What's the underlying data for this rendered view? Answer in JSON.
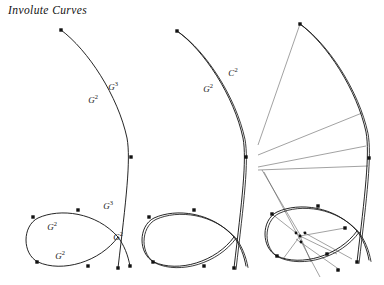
{
  "figure": {
    "title": "Involute Curves",
    "background_color": "#ffffff",
    "stroke_color": "#1a1a1a",
    "thin_stroke_color": "#555555",
    "marker_color": "#111111",
    "width": 384,
    "height": 285
  },
  "chart_data": {
    "type": "diagram",
    "title": "Involute Curves",
    "xlabel": "",
    "ylabel": "",
    "grid": false,
    "legend": null,
    "panels": [
      {
        "id": "left",
        "name": "single-curve-panel",
        "curve_style": "single",
        "elements": [
          {
            "kind": "arc",
            "name": "main-arc",
            "path": "M 61 30 C 88 50 118 96 127 138 C 131 160 126 200 118 268",
            "doubled": false
          },
          {
            "kind": "loop",
            "name": "teardrop-loop",
            "path": "M 118 237 C 96 212 60 208 38 218 C 22 226 22 254 38 262 C 62 273 100 262 118 237",
            "doubled": false
          },
          {
            "kind": "tail",
            "name": "loop-tail",
            "path": "M 118 237 C 124 245 128 255 130 266",
            "doubled": false
          }
        ],
        "markers": [
          {
            "x": 61,
            "y": 30,
            "shape": "square"
          },
          {
            "x": 131,
            "y": 157,
            "shape": "square"
          },
          {
            "x": 118,
            "y": 268,
            "shape": "square"
          },
          {
            "x": 33,
            "y": 217,
            "shape": "square"
          },
          {
            "x": 37,
            "y": 262,
            "shape": "square"
          },
          {
            "x": 78,
            "y": 210,
            "shape": "square"
          },
          {
            "x": 88,
            "y": 266,
            "shape": "square"
          },
          {
            "x": 130,
            "y": 266,
            "shape": "square"
          }
        ],
        "labels": [
          {
            "text": "G",
            "sup": "2",
            "x": 93,
            "y": 100
          },
          {
            "text": "G",
            "sup": "3",
            "x": 113,
            "y": 87
          },
          {
            "text": "G",
            "sup": "3",
            "x": 108,
            "y": 206
          },
          {
            "text": "G",
            "sup": "2",
            "x": 118,
            "y": 237
          },
          {
            "text": "G",
            "sup": "2",
            "x": 52,
            "y": 227
          },
          {
            "text": "G",
            "sup": "2",
            "x": 60,
            "y": 256
          }
        ]
      },
      {
        "id": "middle",
        "name": "doubled-curve-panel",
        "curve_style": "doubled",
        "elements": [
          {
            "kind": "arc",
            "name": "main-arc",
            "path": "M 177 31 C 204 50 234 96 243 138 C 247 160 242 200 234 268",
            "doubled": true
          },
          {
            "kind": "loop",
            "name": "teardrop-loop",
            "path": "M 234 237 C 212 212 176 208 154 218 C 138 226 138 254 154 262 C 178 273 216 262 234 237",
            "doubled": true
          },
          {
            "kind": "tail",
            "name": "loop-tail",
            "path": "M 234 237 C 240 245 244 255 246 266",
            "doubled": true
          }
        ],
        "markers": [
          {
            "x": 177,
            "y": 31,
            "shape": "square"
          },
          {
            "x": 246,
            "y": 157,
            "shape": "square"
          },
          {
            "x": 234,
            "y": 268,
            "shape": "square"
          },
          {
            "x": 149,
            "y": 217,
            "shape": "square"
          },
          {
            "x": 153,
            "y": 262,
            "shape": "square"
          },
          {
            "x": 194,
            "y": 210,
            "shape": "square"
          },
          {
            "x": 204,
            "y": 266,
            "shape": "square"
          }
        ],
        "labels": [
          {
            "text": "G",
            "sup": "2",
            "x": 208,
            "y": 89
          },
          {
            "text": "C",
            "sup": "2",
            "x": 233,
            "y": 73
          }
        ]
      },
      {
        "id": "right",
        "name": "involute-ray-panel",
        "curve_style": "doubled",
        "elements": [
          {
            "kind": "arc",
            "name": "main-arc",
            "path": "M 300 24 C 327 44 357 90 366 132 C 370 154 365 194 357 262",
            "doubled": true
          },
          {
            "kind": "loop",
            "name": "teardrop-loop",
            "path": "M 357 231 C 335 206 299 202 277 212 C 261 220 261 248 277 256 C 301 267 339 256 357 231",
            "doubled": true
          },
          {
            "kind": "tail",
            "name": "loop-tail",
            "path": "M 357 231 C 363 239 367 249 369 260",
            "doubled": true
          }
        ],
        "rays": [
          {
            "x1": 300,
            "y1": 24,
            "x2": 258,
            "y2": 145
          },
          {
            "x1": 362,
            "y1": 113,
            "x2": 258,
            "y2": 155
          },
          {
            "x1": 366,
            "y1": 146,
            "x2": 258,
            "y2": 167
          },
          {
            "x1": 368,
            "y1": 166,
            "x2": 258,
            "y2": 170
          },
          {
            "x1": 264,
            "y1": 172,
            "x2": 320,
            "y2": 277
          },
          {
            "x1": 262,
            "y1": 170,
            "x2": 302,
            "y2": 238
          },
          {
            "x1": 300,
            "y1": 236,
            "x2": 272,
            "y2": 214
          },
          {
            "x1": 300,
            "y1": 236,
            "x2": 345,
            "y2": 228
          },
          {
            "x1": 300,
            "y1": 236,
            "x2": 337,
            "y2": 254
          },
          {
            "x1": 300,
            "y1": 236,
            "x2": 283,
            "y2": 259
          },
          {
            "x1": 300,
            "y1": 236,
            "x2": 311,
            "y2": 262
          },
          {
            "x1": 303,
            "y1": 232,
            "x2": 352,
            "y2": 259
          },
          {
            "x1": 296,
            "y1": 239,
            "x2": 340,
            "y2": 270
          }
        ],
        "markers": [
          {
            "x": 300,
            "y": 24,
            "shape": "square"
          },
          {
            "x": 369,
            "y": 158,
            "shape": "square"
          },
          {
            "x": 357,
            "y": 262,
            "shape": "square"
          },
          {
            "x": 272,
            "y": 214,
            "shape": "square"
          },
          {
            "x": 277,
            "y": 256,
            "shape": "square"
          },
          {
            "x": 318,
            "y": 206,
            "shape": "square"
          },
          {
            "x": 327,
            "y": 254,
            "shape": "square"
          },
          {
            "x": 345,
            "y": 228,
            "shape": "square"
          },
          {
            "x": 338,
            "y": 270,
            "shape": "square"
          },
          {
            "x": 300,
            "y": 236,
            "shape": "dot"
          },
          {
            "x": 296,
            "y": 233,
            "shape": "dot"
          },
          {
            "x": 305,
            "y": 233,
            "shape": "dot"
          },
          {
            "x": 301,
            "y": 242,
            "shape": "dot"
          }
        ],
        "labels": []
      }
    ]
  }
}
